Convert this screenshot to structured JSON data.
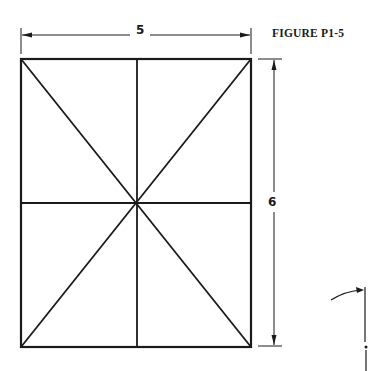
{
  "figure": {
    "label": "FIGURE P1-5",
    "width_dimension": "5",
    "height_dimension": "6"
  },
  "colors": {
    "stroke": "#1a1a1a",
    "background": "#ffffff"
  },
  "geometry": {
    "rectangle": {
      "left": 21,
      "top": 59,
      "right": 251,
      "bottom": 347
    },
    "center": [
      137,
      203
    ]
  }
}
